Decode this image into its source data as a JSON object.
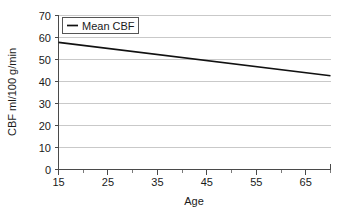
{
  "chart_data": {
    "type": "line",
    "title": "",
    "xlabel": "Age",
    "ylabel": "CBF ml/100 g/min",
    "xlim": [
      15,
      70
    ],
    "ylim": [
      0,
      70
    ],
    "grid": true,
    "grid_axis": "y",
    "legend_position": "top-left-inside",
    "x_ticks": [
      15,
      25,
      35,
      45,
      55,
      65
    ],
    "x_tick_labels": [
      "15",
      "25",
      "35",
      "45",
      "55",
      "65"
    ],
    "x_minor_tick_step": 5,
    "y_ticks": [
      0,
      10,
      20,
      30,
      40,
      50,
      60,
      70
    ],
    "y_tick_labels": [
      "0",
      "10",
      "20",
      "30",
      "40",
      "50",
      "60",
      "70"
    ],
    "series": [
      {
        "name": "Mean CBF",
        "color": "#111111",
        "x": [
          15,
          70
        ],
        "values": [
          57.8,
          42.6
        ]
      }
    ]
  },
  "legend": {
    "entries": [
      {
        "label": "Mean CBF",
        "marker": "line-swatch"
      }
    ]
  },
  "axes": {
    "y_axis_title": "CBF ml/100 g/min",
    "x_axis_title": "Age"
  }
}
